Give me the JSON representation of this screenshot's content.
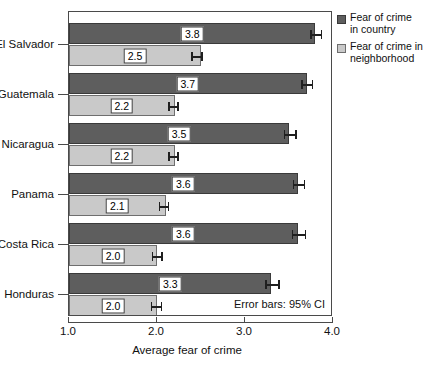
{
  "chart_data": {
    "type": "bar",
    "orientation": "horizontal",
    "title": "",
    "xlabel": "Average fear of crime",
    "ylabel": "",
    "xlim": [
      1.0,
      4.0
    ],
    "xticks": [
      "1.0",
      "2.0",
      "3.0",
      "4.0"
    ],
    "xtick_values": [
      1.0,
      2.0,
      3.0,
      4.0
    ],
    "grid": false,
    "legend_position": "right",
    "categories": [
      "El Salvador",
      "Guatemala",
      "Nicaragua",
      "Panama",
      "Costa Rica",
      "Honduras"
    ],
    "series": [
      {
        "name": "Fear of crime in country",
        "color": "#5e5e5e",
        "values": [
          3.8,
          3.7,
          3.5,
          3.6,
          3.6,
          3.3
        ],
        "labels": [
          "3.8",
          "3.7",
          "3.5",
          "3.6",
          "3.6",
          "3.3"
        ],
        "error_low": [
          3.74,
          3.64,
          3.44,
          3.54,
          3.53,
          3.23
        ],
        "error_high": [
          3.86,
          3.76,
          3.57,
          3.67,
          3.68,
          3.38
        ]
      },
      {
        "name": "Fear of crime in neighborhood",
        "color": "#c9c9c9",
        "values": [
          2.5,
          2.2,
          2.2,
          2.1,
          2.0,
          2.0
        ],
        "labels": [
          "2.5",
          "2.2",
          "2.2",
          "2.1",
          "2.0",
          "2.0"
        ],
        "error_low": [
          2.39,
          2.13,
          2.13,
          2.02,
          1.94,
          1.93
        ],
        "error_high": [
          2.5,
          2.23,
          2.23,
          2.12,
          2.05,
          2.04
        ]
      }
    ],
    "annotation": "Error bars: 95% CI"
  },
  "legend": {
    "items": [
      {
        "label_line1": "Fear of crime",
        "label_line2": "in country"
      },
      {
        "label_line1": "Fear of crime in",
        "label_line2": "neighborhood"
      }
    ]
  },
  "axis": {
    "x_title": "Average fear of crime",
    "x_ticks": [
      "1.0",
      "2.0",
      "3.0",
      "4.0"
    ],
    "y_labels": [
      "El Salvador",
      "Guatemala",
      "Nicaragua",
      "Panama",
      "Costa Rica",
      "Honduras"
    ]
  },
  "note": {
    "text": "Error bars: 95% CI"
  },
  "colors": {
    "country_bar": "#5e5e5e",
    "neighborhood_bar": "#c9c9c9",
    "frame": "#4a4a4a",
    "background": "#ffffff"
  }
}
